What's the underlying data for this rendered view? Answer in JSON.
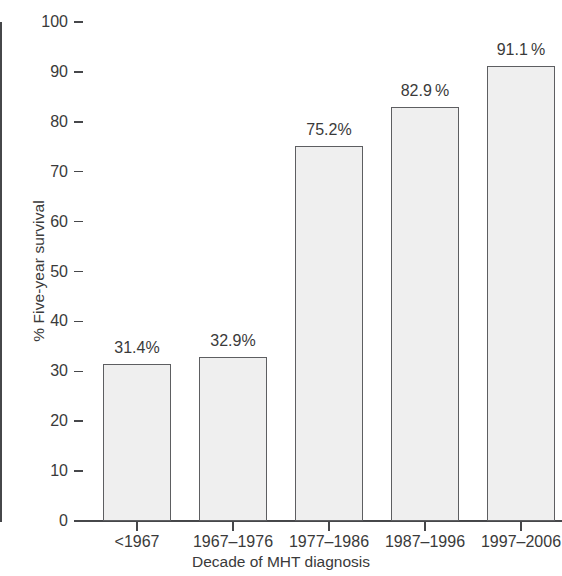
{
  "chart_data": {
    "type": "bar",
    "title": "",
    "xlabel": "Decade of MHT diagnosis",
    "ylabel": "% Five-year survival",
    "categories": [
      "<1967",
      "1967–1976",
      "1977–1986",
      "1987–1996",
      "1997–2006"
    ],
    "values": [
      31.4,
      32.9,
      75.2,
      82.9,
      91.1
    ],
    "data_labels": [
      "31.4%",
      "32.9%",
      "75.2%",
      "82.9 %",
      "91.1 %"
    ],
    "ylim": [
      0,
      100
    ],
    "ytick_values": [
      0,
      10,
      20,
      30,
      40,
      50,
      60,
      70,
      80,
      90,
      100
    ],
    "ytick_labels": [
      "0",
      "10",
      "20",
      "30",
      "40",
      "50",
      "60",
      "70",
      "80",
      "90",
      "100"
    ],
    "grid": false,
    "legend": false,
    "bar_fill_color": "#efefef",
    "bar_edge_color": "#5d5e61",
    "axis_color": "#46474a",
    "text_color": "#3a3a3a"
  }
}
